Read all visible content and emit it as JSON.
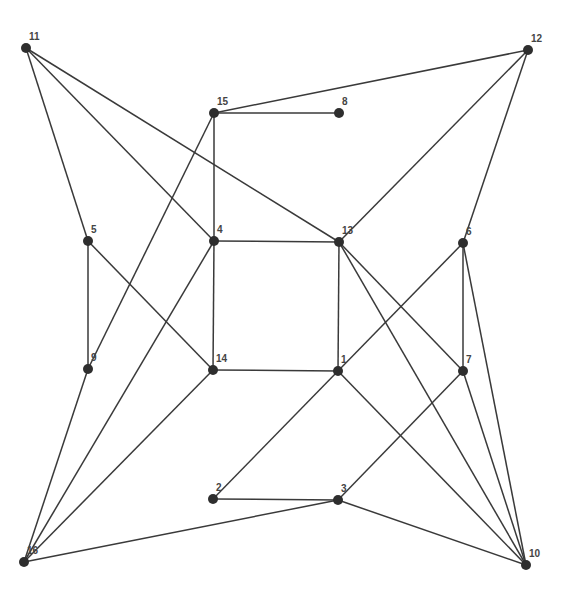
{
  "diagram": {
    "type": "undirected-graph",
    "nodes": [
      {
        "id": "1",
        "label": "1",
        "x": 338,
        "y": 371
      },
      {
        "id": "2",
        "label": "2",
        "x": 213,
        "y": 499
      },
      {
        "id": "3",
        "label": "3",
        "x": 338,
        "y": 500
      },
      {
        "id": "4",
        "label": "4",
        "x": 214,
        "y": 241
      },
      {
        "id": "5",
        "label": "5",
        "x": 88,
        "y": 241
      },
      {
        "id": "6",
        "label": "6",
        "x": 463,
        "y": 243
      },
      {
        "id": "7",
        "label": "7",
        "x": 463,
        "y": 371
      },
      {
        "id": "8",
        "label": "8",
        "x": 339,
        "y": 113
      },
      {
        "id": "9",
        "label": "9",
        "x": 88,
        "y": 369
      },
      {
        "id": "10",
        "label": "10",
        "x": 526,
        "y": 565
      },
      {
        "id": "11",
        "label": "11",
        "x": 26,
        "y": 48
      },
      {
        "id": "12",
        "label": "12",
        "x": 528,
        "y": 50
      },
      {
        "id": "13",
        "label": "13",
        "x": 339,
        "y": 242
      },
      {
        "id": "14",
        "label": "14",
        "x": 213,
        "y": 370
      },
      {
        "id": "15",
        "label": "15",
        "x": 214,
        "y": 113
      },
      {
        "id": "16",
        "label": "16",
        "x": 24,
        "y": 562
      }
    ],
    "edges": [
      [
        "11",
        "5"
      ],
      [
        "11",
        "4"
      ],
      [
        "11",
        "13"
      ],
      [
        "15",
        "12"
      ],
      [
        "15",
        "8"
      ],
      [
        "15",
        "4"
      ],
      [
        "15",
        "9"
      ],
      [
        "12",
        "13"
      ],
      [
        "12",
        "6"
      ],
      [
        "5",
        "9"
      ],
      [
        "5",
        "14"
      ],
      [
        "4",
        "13"
      ],
      [
        "4",
        "14"
      ],
      [
        "4",
        "16"
      ],
      [
        "13",
        "1"
      ],
      [
        "13",
        "7"
      ],
      [
        "13",
        "10"
      ],
      [
        "6",
        "7"
      ],
      [
        "6",
        "10"
      ],
      [
        "6",
        "2"
      ],
      [
        "14",
        "1"
      ],
      [
        "14",
        "16"
      ],
      [
        "9",
        "16"
      ],
      [
        "1",
        "10"
      ],
      [
        "7",
        "3"
      ],
      [
        "7",
        "10"
      ],
      [
        "2",
        "3"
      ],
      [
        "3",
        "16"
      ],
      [
        "3",
        "10"
      ]
    ],
    "colors": {
      "edge": "#3a3a3a",
      "node": "#2e2e2e",
      "label": "#444444",
      "background": "#ffffff"
    }
  }
}
